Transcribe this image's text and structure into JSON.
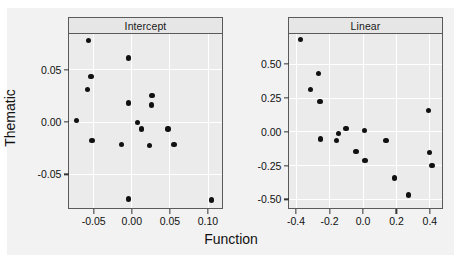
{
  "figure": {
    "axis_x_label": "Function",
    "axis_y_label": "Thematic",
    "background_color": "#f2f2f2",
    "panel_fill_color": "#ebebeb",
    "strip_fill_color": "#e6e6e6",
    "point_color": "#111111",
    "grid_color": "#ffffff"
  },
  "chart_data": [
    {
      "type": "scatter",
      "title": "Intercept",
      "xlabel": "Function",
      "ylabel": "Thematic",
      "xlim": [
        -0.082,
        0.118
      ],
      "ylim": [
        -0.082,
        0.084
      ],
      "xticks": [
        -0.05,
        0.0,
        0.05,
        0.1
      ],
      "xtick_labels": [
        "-0.05",
        "0.00",
        "0.05",
        "0.10"
      ],
      "yticks": [
        0.05,
        0.0,
        -0.05
      ],
      "ytick_labels": [
        "0.05",
        "0.00",
        "-0.05"
      ],
      "grid": true,
      "legend": "none",
      "x": [
        -0.072,
        -0.056,
        -0.058,
        -0.053,
        -0.052,
        -0.013,
        -0.004,
        -0.004,
        -0.004,
        0.008,
        0.013,
        0.026,
        0.027,
        0.024,
        0.048,
        0.056,
        0.105
      ],
      "y": [
        0.001,
        0.078,
        0.031,
        0.043,
        -0.018,
        -0.022,
        0.061,
        0.018,
        -0.074,
        -0.001,
        -0.007,
        0.016,
        0.025,
        -0.023,
        -0.007,
        -0.022,
        -0.075
      ]
    },
    {
      "type": "scatter",
      "title": "Linear",
      "xlabel": "Function",
      "ylabel": "Thematic",
      "xlim": [
        -0.44,
        0.47
      ],
      "ylim": [
        -0.56,
        0.72
      ],
      "xticks": [
        -0.4,
        -0.2,
        0.0,
        0.2,
        0.4
      ],
      "xtick_labels": [
        "-0.4",
        "-0.2",
        "0.0",
        "0.2",
        "0.4"
      ],
      "yticks": [
        0.5,
        0.25,
        0.0,
        -0.25,
        -0.5
      ],
      "ytick_labels": [
        "0.50",
        "0.25",
        "0.00",
        "-0.25",
        "-0.50"
      ],
      "grid": true,
      "legend": "none",
      "x": [
        -0.37,
        -0.31,
        -0.265,
        -0.255,
        -0.25,
        -0.155,
        -0.145,
        -0.1,
        -0.04,
        0.01,
        0.015,
        0.14,
        0.19,
        0.275,
        0.395,
        0.4,
        0.415
      ],
      "y": [
        0.68,
        0.31,
        0.43,
        0.22,
        -0.055,
        -0.065,
        -0.015,
        0.02,
        -0.15,
        0.005,
        -0.215,
        -0.065,
        -0.345,
        -0.47,
        0.155,
        -0.155,
        -0.25
      ]
    }
  ]
}
